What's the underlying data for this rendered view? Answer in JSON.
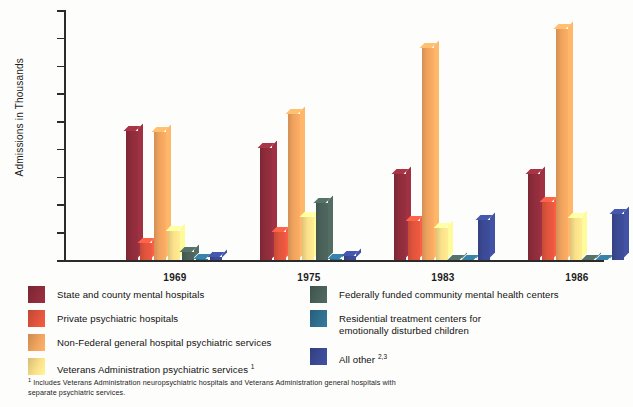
{
  "chart_data": {
    "type": "bar",
    "title": "",
    "xlabel": "",
    "ylabel": "Admissions in Thousands",
    "ylim": [
      0,
      900
    ],
    "ytick_step": 100,
    "yticks": [
      900,
      800,
      700,
      600,
      500,
      400,
      300,
      200,
      100,
      0
    ],
    "grid": false,
    "legend_position": "bottom",
    "categories": [
      "1969",
      "1975",
      "1983",
      "1986"
    ],
    "series": [
      {
        "name": "State and county mental hospitals",
        "color": "#8e2c3b",
        "values": [
          465,
          405,
          310,
          310
        ]
      },
      {
        "name": "Private psychiatric hospitals",
        "color": "#e1543d",
        "values": [
          60,
          100,
          140,
          210
        ]
      },
      {
        "name": "Non-Federal general hospital psychiatric services",
        "color": "#f0a35e",
        "values": [
          460,
          525,
          765,
          830
        ]
      },
      {
        "name": "Veterans Administration psychiatric services",
        "color": "#fbe08a",
        "values": [
          105,
          155,
          115,
          150
        ]
      },
      {
        "name": "Federally funded community mental health centers",
        "color": "#4a6159",
        "values": [
          30,
          205,
          0,
          0
        ]
      },
      {
        "name": "Residential treatment centers for emotionally disturbed children",
        "color": "#2f6f8f",
        "values": [
          5,
          5,
          0,
          0
        ]
      },
      {
        "name": "All other",
        "color": "#3b4a94",
        "values": [
          10,
          15,
          145,
          165
        ]
      }
    ]
  },
  "axis": {
    "ylabel": "Admissions in Thousands",
    "ticks": [
      "900",
      "800",
      "700",
      "600",
      "500",
      "400",
      "300",
      "200",
      "100",
      "0"
    ],
    "categories": [
      "1969",
      "1975",
      "1983",
      "1986"
    ]
  },
  "legend": {
    "column1": [
      {
        "label": "State and county mental hospitals",
        "color": "#8e2c3b",
        "superscript": ""
      },
      {
        "label": "Private psychiatric hospitals",
        "color": "#e1543d",
        "superscript": ""
      },
      {
        "label": "Non-Federal general hospital psychiatric services",
        "color": "#f0a35e",
        "superscript": ""
      },
      {
        "label": "Veterans Administration psychiatric services",
        "color": "#fbe08a",
        "superscript": "1"
      }
    ],
    "column2": [
      {
        "label": "Federally funded community mental health centers",
        "color": "#4a6159",
        "superscript": ""
      },
      {
        "label": "Residential treatment centers for",
        "label2": "emotionally disturbed children",
        "color": "#2f6f8f",
        "superscript": ""
      },
      {
        "label": "All other",
        "color": "#3b4a94",
        "superscript": "2,3"
      }
    ]
  },
  "footnote": {
    "marker": "1",
    "line1": "Includes Veterans Administration neuropsychiatric hospitals and Veterans Administration general hospitals with",
    "line2": "separate psychiatric services."
  }
}
